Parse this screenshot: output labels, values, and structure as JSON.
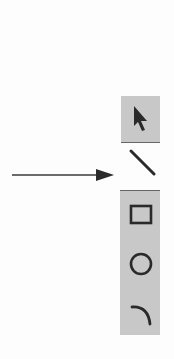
{
  "figure": {
    "pointer_arrow": {
      "from_x": 12,
      "to_x": 112,
      "y": 175
    },
    "tools": [
      {
        "name": "select",
        "icon": "arrow-pointer-icon",
        "selected": false,
        "stippled": true
      },
      {
        "name": "line",
        "icon": "line-icon",
        "selected": true,
        "stippled": false
      },
      {
        "name": "rectangle",
        "icon": "rectangle-icon",
        "selected": false,
        "stippled": true
      },
      {
        "name": "ellipse",
        "icon": "circle-icon",
        "selected": false,
        "stippled": true
      },
      {
        "name": "arc",
        "icon": "arc-icon",
        "selected": false,
        "stippled": true
      }
    ],
    "colors": {
      "stroke": "#2a2a2a",
      "stipple": "#c8c8c8",
      "background": "#fdfdfd"
    }
  }
}
